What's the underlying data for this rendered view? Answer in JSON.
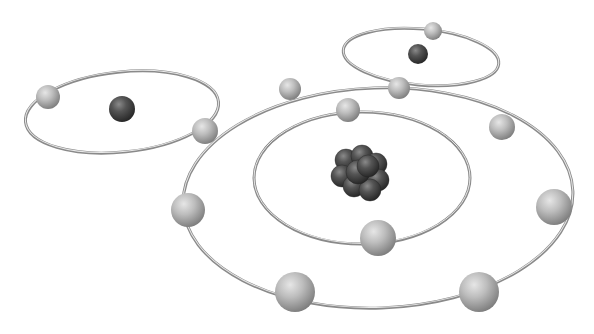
{
  "scene": {
    "description": "3D render of atom models with electrons orbiting nuclei on silver rings",
    "background": "#ffffff",
    "colors": {
      "ring": "#8a8a8a",
      "ring_highlight": "#e8e8e8",
      "electron": "#b8b8b8",
      "electron_shadow": "#8c8c8c",
      "nucleus": "#4a4a4a",
      "nucleus_dark": "#2e2e2e"
    },
    "orbits": [
      {
        "name": "outer-orbit",
        "cx": 378,
        "cy": 198,
        "rx": 195,
        "ry": 110,
        "rot": -2
      },
      {
        "name": "inner-orbit",
        "cx": 362,
        "cy": 178,
        "rx": 108,
        "ry": 66,
        "rot": 0
      },
      {
        "name": "left-atom-orbit",
        "cx": 122,
        "cy": 112,
        "rx": 97,
        "ry": 40,
        "rot": -6
      },
      {
        "name": "top-right-atom-orbit",
        "cx": 421,
        "cy": 57,
        "rx": 78,
        "ry": 28,
        "rot": 5
      }
    ],
    "nuclei": [
      {
        "name": "left-atom-nucleus",
        "cx": 122,
        "cy": 109,
        "r": 13
      },
      {
        "name": "top-right-atom-nucleus",
        "cx": 418,
        "cy": 54,
        "r": 10
      }
    ],
    "cluster": {
      "name": "central-nucleus",
      "cx": 360,
      "cy": 170
    },
    "electrons": [
      {
        "cx": 48,
        "cy": 97,
        "r": 12
      },
      {
        "cx": 205,
        "cy": 131,
        "r": 13
      },
      {
        "cx": 290,
        "cy": 89,
        "r": 11
      },
      {
        "cx": 399,
        "cy": 88,
        "r": 11
      },
      {
        "cx": 433,
        "cy": 31,
        "r": 9
      },
      {
        "cx": 348,
        "cy": 110,
        "r": 12
      },
      {
        "cx": 502,
        "cy": 127,
        "r": 13
      },
      {
        "cx": 554,
        "cy": 207,
        "r": 18
      },
      {
        "cx": 188,
        "cy": 210,
        "r": 17
      },
      {
        "cx": 378,
        "cy": 238,
        "r": 18
      },
      {
        "cx": 295,
        "cy": 292,
        "r": 20
      },
      {
        "cx": 479,
        "cy": 292,
        "r": 20
      }
    ]
  }
}
